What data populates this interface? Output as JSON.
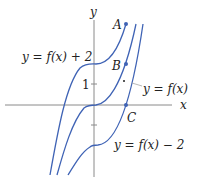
{
  "diagram": {
    "axes": {
      "x_label": "x",
      "y_label": "y",
      "tick_label_1": "1"
    },
    "curves": [
      {
        "name": "shifted-up",
        "label": "y = f(x) + 2",
        "shift": 2
      },
      {
        "name": "original",
        "label": "y = f(x)",
        "shift": 0
      },
      {
        "name": "shifted-down",
        "label": "y = f(x) − 2",
        "shift": -2
      }
    ],
    "points": [
      {
        "label": "A"
      },
      {
        "label": "B"
      },
      {
        "label": "C"
      }
    ],
    "colors": {
      "curve": "#3f63b5",
      "axis": "#888888",
      "text": "#222222"
    }
  }
}
